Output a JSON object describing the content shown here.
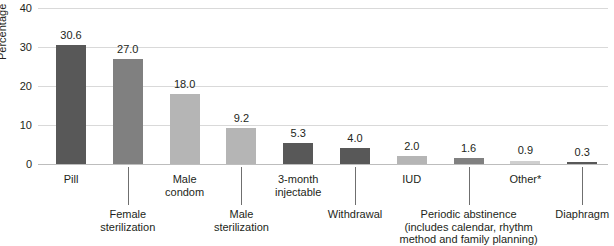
{
  "chart_data": {
    "type": "bar",
    "title": "",
    "xlabel": "",
    "ylabel": "Percentage",
    "ylim": [
      0,
      40
    ],
    "yticks": [
      0,
      10,
      20,
      30,
      40
    ],
    "grid": true,
    "legend": "none",
    "categories": [
      "Pill",
      "Female sterilization",
      "Male condom",
      "Male sterilization",
      "3-month injectable",
      "Withdrawal",
      "IUD",
      "Periodic abstinence (includes calendar, rhythm method and family planning)",
      "Other*",
      "Diaphragm"
    ],
    "values": [
      30.6,
      27.0,
      18.0,
      9.2,
      5.3,
      4.0,
      2.0,
      1.6,
      0.9,
      0.3
    ],
    "value_labels": [
      "30.6",
      "27.0",
      "18.0",
      "9.2",
      "5.3",
      "4.0",
      "2.0",
      "1.6",
      "0.9",
      "0.3"
    ],
    "bar_colors": [
      "#585858",
      "#808080",
      "#b5b5b5",
      "#b5b5b5",
      "#585858",
      "#585858",
      "#b5b5b5",
      "#808080",
      "#cfcfcf",
      "#585858"
    ],
    "category_lines": [
      [
        "Pill"
      ],
      [
        "Female",
        "sterilization"
      ],
      [
        "Male",
        "condom"
      ],
      [
        "Male",
        "sterilization"
      ],
      [
        "3-month",
        "injectable"
      ],
      [
        "Withdrawal"
      ],
      [
        "IUD"
      ],
      [
        "Periodic abstinence",
        "(includes calendar, rhythm",
        "method and family planning)"
      ],
      [
        "Other*"
      ],
      [
        "Diaphragm"
      ]
    ],
    "label_row": [
      "top",
      "bottom",
      "top",
      "bottom",
      "top",
      "bottom",
      "top",
      "bottom",
      "top",
      "bottom"
    ]
  },
  "axis": {
    "tick_40": "40",
    "tick_30": "30",
    "tick_20": "20",
    "tick_10": "10",
    "tick_0": "0",
    "y_title": "Percentage"
  },
  "colors": {
    "gridline": "#d9d9d9",
    "baseline": "#bdbdbd",
    "text": "#231f20",
    "leader": "#6f6f6f",
    "background": "#ffffff"
  }
}
